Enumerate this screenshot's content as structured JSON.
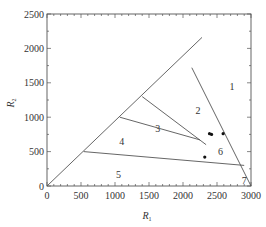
{
  "chart_data": {
    "type": "scatter",
    "title": "",
    "xlabel": "R1",
    "ylabel": "R2",
    "xlim": [
      0,
      3000
    ],
    "ylim": [
      0,
      2500
    ],
    "grid": false,
    "x_ticks": [
      0,
      500,
      1000,
      1500,
      2000,
      2500,
      3000
    ],
    "y_ticks": [
      0,
      500,
      1000,
      1500,
      2000,
      2500
    ],
    "boundary_lines": [
      {
        "name": "diagonal",
        "points": [
          [
            0,
            0
          ],
          [
            2280,
            2160
          ]
        ]
      },
      {
        "name": "boundary-1-2",
        "points": [
          [
            2130,
            1720
          ],
          [
            3000,
            0
          ]
        ]
      },
      {
        "name": "boundary-2-3",
        "points": [
          [
            1400,
            1300
          ],
          [
            2340,
            600
          ]
        ]
      },
      {
        "name": "boundary-3-4",
        "points": [
          [
            1070,
            1000
          ],
          [
            2250,
            670
          ]
        ]
      },
      {
        "name": "boundary-4-5",
        "points": [
          [
            540,
            500
          ],
          [
            2900,
            300
          ]
        ]
      }
    ],
    "region_labels": [
      {
        "label": "1",
        "x": 2720,
        "y": 1440
      },
      {
        "label": "2",
        "x": 2220,
        "y": 1100
      },
      {
        "label": "3",
        "x": 1630,
        "y": 840
      },
      {
        "label": "4",
        "x": 1100,
        "y": 640
      },
      {
        "label": "5",
        "x": 1050,
        "y": 170
      },
      {
        "label": "6",
        "x": 2550,
        "y": 500
      },
      {
        "label": "7",
        "x": 2900,
        "y": 80
      }
    ],
    "points": [
      {
        "x": 2390,
        "y": 760
      },
      {
        "x": 2420,
        "y": 750
      },
      {
        "x": 2590,
        "y": 760
      },
      {
        "x": 2320,
        "y": 420
      }
    ]
  },
  "axes": {
    "x_title": "R",
    "x_title_sub": "1",
    "y_title": "R",
    "y_title_sub": "2"
  }
}
